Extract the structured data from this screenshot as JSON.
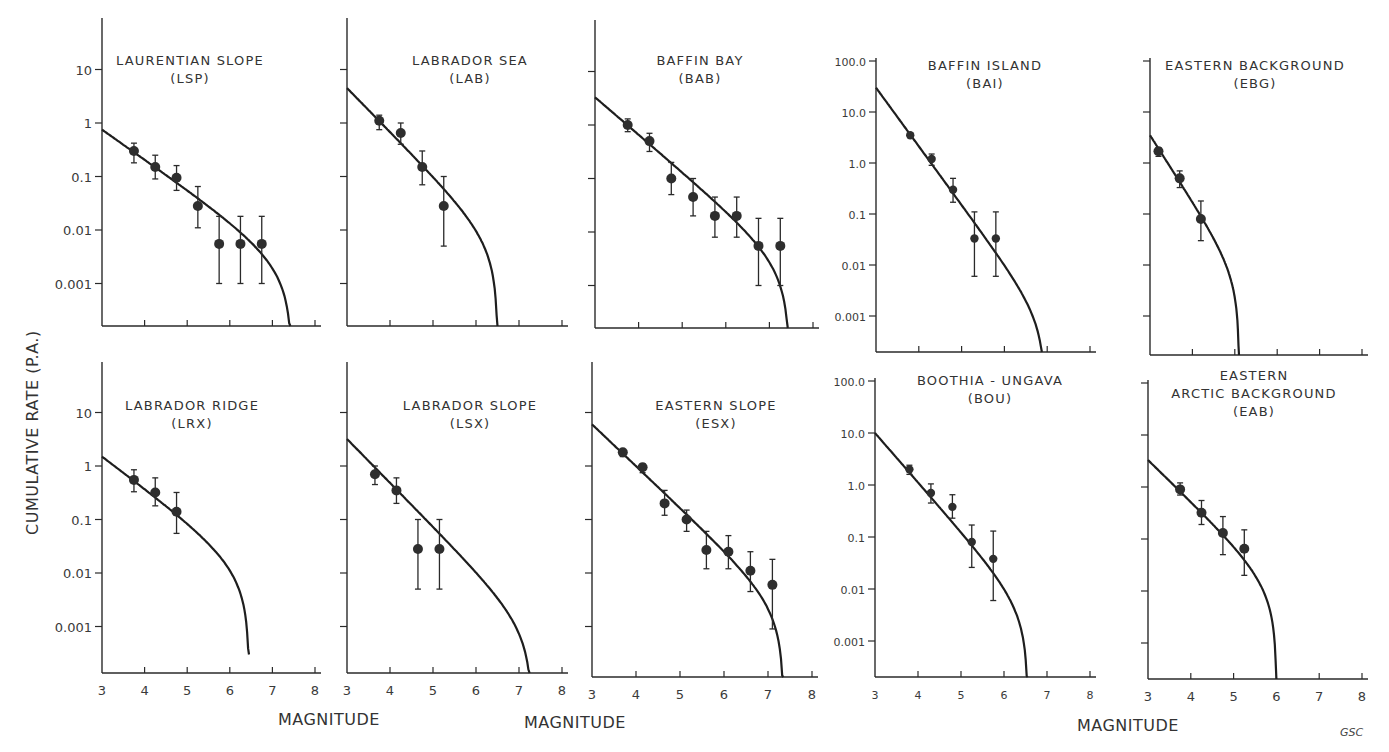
{
  "figure": {
    "ylabel": "CUMULATIVE   RATE      (P.A.)",
    "xlabels": [
      "MAGNITUDE",
      "MAGNITUDE",
      "MAGNITUDE"
    ],
    "credit": "GSC"
  },
  "chart_data": [
    {
      "type": "scatter",
      "id": "LSP",
      "title": "LAURENTIAN SLOPE",
      "subtitle": "(LSP)",
      "xlabel": "MAGNITUDE",
      "ylabel": "CUMULATIVE RATE (P.A.)",
      "yscale": "log",
      "xlim": [
        3,
        8
      ],
      "ylim": [
        0.0001,
        100
      ],
      "xticks": [
        "3",
        "4",
        "5",
        "6",
        "7",
        "8"
      ],
      "xtick_labels_visible": false,
      "yticks": [
        {
          "v": 10,
          "label": "10"
        },
        {
          "v": 1,
          "label": "1"
        },
        {
          "v": 0.1,
          "label": "0.1"
        },
        {
          "v": 0.01,
          "label": "0.01"
        },
        {
          "v": 0.001,
          "label": "0.001"
        }
      ],
      "points": [
        {
          "x": 3.75,
          "y": 0.3,
          "lo": 0.18,
          "hi": 0.42
        },
        {
          "x": 4.25,
          "y": 0.15,
          "lo": 0.09,
          "hi": 0.25
        },
        {
          "x": 4.75,
          "y": 0.095,
          "lo": 0.055,
          "hi": 0.16
        },
        {
          "x": 5.25,
          "y": 0.028,
          "lo": 0.011,
          "hi": 0.065
        },
        {
          "x": 5.75,
          "y": 0.0055,
          "lo": 0.001,
          "hi": 0.018
        },
        {
          "x": 6.25,
          "y": 0.0055,
          "lo": 0.001,
          "hi": 0.018
        },
        {
          "x": 6.75,
          "y": 0.0055,
          "lo": 0.001,
          "hi": 0.018
        }
      ],
      "fit": {
        "y_at_3": 0.75,
        "slope_per_mag": -0.56,
        "mmax": 7.45
      }
    },
    {
      "type": "scatter",
      "id": "LAB",
      "title": "LABRADOR  SEA",
      "subtitle": "(LAB)",
      "yscale": "log",
      "xlim": [
        3,
        8
      ],
      "ylim": [
        0.0001,
        100
      ],
      "xticks": [
        "3",
        "4",
        "5",
        "6",
        "7",
        "8"
      ],
      "xtick_labels_visible": false,
      "yticks": [
        {
          "v": 10,
          "label": ""
        },
        {
          "v": 1,
          "label": ""
        },
        {
          "v": 0.1,
          "label": ""
        },
        {
          "v": 0.01,
          "label": ""
        },
        {
          "v": 0.001,
          "label": ""
        }
      ],
      "points": [
        {
          "x": 3.75,
          "y": 1.1,
          "lo": 0.75,
          "hi": 1.4
        },
        {
          "x": 4.25,
          "y": 0.65,
          "lo": 0.4,
          "hi": 1.0
        },
        {
          "x": 4.75,
          "y": 0.15,
          "lo": 0.07,
          "hi": 0.3
        },
        {
          "x": 5.25,
          "y": 0.028,
          "lo": 0.005,
          "hi": 0.1
        }
      ],
      "fit": {
        "y_at_3": 4.5,
        "slope_per_mag": -0.82,
        "mmax": 6.5
      }
    },
    {
      "type": "scatter",
      "id": "BAB",
      "title": "BAFFIN  BAY",
      "subtitle": "(BAB)",
      "yscale": "log",
      "xlim": [
        3,
        8
      ],
      "ylim": [
        0.0001,
        100
      ],
      "xticks": [
        "3",
        "4",
        "5",
        "6",
        "7",
        "8"
      ],
      "xtick_labels_visible": false,
      "yticks": [
        {
          "v": 10,
          "label": ""
        },
        {
          "v": 1,
          "label": ""
        },
        {
          "v": 0.1,
          "label": ""
        },
        {
          "v": 0.01,
          "label": ""
        },
        {
          "v": 0.001,
          "label": ""
        }
      ],
      "points": [
        {
          "x": 3.75,
          "y": 1.0,
          "lo": 0.75,
          "hi": 1.3
        },
        {
          "x": 4.25,
          "y": 0.5,
          "lo": 0.32,
          "hi": 0.7
        },
        {
          "x": 4.75,
          "y": 0.1,
          "lo": 0.05,
          "hi": 0.2
        },
        {
          "x": 5.25,
          "y": 0.045,
          "lo": 0.02,
          "hi": 0.1
        },
        {
          "x": 5.75,
          "y": 0.02,
          "lo": 0.008,
          "hi": 0.045
        },
        {
          "x": 6.25,
          "y": 0.02,
          "lo": 0.008,
          "hi": 0.045
        },
        {
          "x": 6.75,
          "y": 0.0055,
          "lo": 0.001,
          "hi": 0.018
        },
        {
          "x": 7.25,
          "y": 0.0055,
          "lo": 0.001,
          "hi": 0.018
        }
      ],
      "fit": {
        "y_at_3": 3.3,
        "slope_per_mag": -0.7,
        "mmax": 7.45
      }
    },
    {
      "type": "scatter",
      "id": "BAI",
      "title": "BAFFIN  ISLAND",
      "subtitle": "(BAI)",
      "yscale": "log",
      "xlim": [
        3,
        8
      ],
      "ylim": [
        0.0002,
        100
      ],
      "xticks": [
        "3",
        "4",
        "5",
        "6",
        "7",
        "8"
      ],
      "xtick_labels_visible": false,
      "yticks": [
        {
          "v": 100,
          "label": "100.0"
        },
        {
          "v": 10,
          "label": "10.0"
        },
        {
          "v": 1,
          "label": "1.0"
        },
        {
          "v": 0.1,
          "label": "0.1"
        },
        {
          "v": 0.01,
          "label": "0.01"
        },
        {
          "v": 0.001,
          "label": "0.001"
        }
      ],
      "points": [
        {
          "x": 3.8,
          "y": 3.5,
          "lo": 3.2,
          "hi": 3.8
        },
        {
          "x": 4.3,
          "y": 1.2,
          "lo": 0.9,
          "hi": 1.5
        },
        {
          "x": 4.8,
          "y": 0.3,
          "lo": 0.17,
          "hi": 0.5
        },
        {
          "x": 5.3,
          "y": 0.033,
          "lo": 0.006,
          "hi": 0.11
        },
        {
          "x": 5.8,
          "y": 0.033,
          "lo": 0.006,
          "hi": 0.11
        }
      ],
      "fit": {
        "y_at_3": 30,
        "slope_per_mag": -1.15,
        "mmax": 6.95
      }
    },
    {
      "type": "scatter",
      "id": "EBG",
      "title": "EASTERN  BACKGROUND",
      "subtitle": "(EBG)",
      "yscale": "log",
      "xlim": [
        3,
        8
      ],
      "ylim": [
        0.0002,
        100
      ],
      "xticks": [
        "3",
        "4",
        "5",
        "6",
        "7",
        "8"
      ],
      "xtick_labels_visible": false,
      "yticks": [
        {
          "v": 100,
          "label": ""
        },
        {
          "v": 10,
          "label": ""
        },
        {
          "v": 1,
          "label": ""
        },
        {
          "v": 0.1,
          "label": ""
        },
        {
          "v": 0.01,
          "label": ""
        },
        {
          "v": 0.001,
          "label": ""
        }
      ],
      "points": [
        {
          "x": 3.2,
          "y": 1.7,
          "lo": 1.35,
          "hi": 2.0
        },
        {
          "x": 3.7,
          "y": 0.5,
          "lo": 0.33,
          "hi": 0.7
        },
        {
          "x": 4.2,
          "y": 0.08,
          "lo": 0.03,
          "hi": 0.18
        }
      ],
      "fit": {
        "y_at_3": 3.5,
        "slope_per_mag": -1.3,
        "mmax": 5.1
      }
    },
    {
      "type": "scatter",
      "id": "LRX",
      "title": "LABRADOR  RIDGE",
      "subtitle": "(LRX)",
      "yscale": "log",
      "xlim": [
        3,
        8
      ],
      "ylim": [
        0.0001,
        100
      ],
      "xticks": [
        "3",
        "4",
        "5",
        "6",
        "7",
        "8"
      ],
      "xtick_labels_visible": true,
      "yticks": [
        {
          "v": 10,
          "label": "10"
        },
        {
          "v": 1,
          "label": "1"
        },
        {
          "v": 0.1,
          "label": "0.1"
        },
        {
          "v": 0.01,
          "label": "0.01"
        },
        {
          "v": 0.001,
          "label": "0.001"
        }
      ],
      "points": [
        {
          "x": 3.75,
          "y": 0.55,
          "lo": 0.33,
          "hi": 0.85
        },
        {
          "x": 4.25,
          "y": 0.32,
          "lo": 0.18,
          "hi": 0.6
        },
        {
          "x": 4.75,
          "y": 0.14,
          "lo": 0.055,
          "hi": 0.32
        }
      ],
      "fit": {
        "y_at_3": 1.5,
        "slope_per_mag": -0.6,
        "mmax": 6.45
      },
      "fit_floor": 0.0003
    },
    {
      "type": "scatter",
      "id": "LSX",
      "title": "LABRADOR  SLOPE",
      "subtitle": "(LSX)",
      "yscale": "log",
      "xlim": [
        3,
        8
      ],
      "ylim": [
        0.0001,
        100
      ],
      "xticks": [
        "3",
        "4",
        "5",
        "6",
        "7",
        "8"
      ],
      "xtick_labels_visible": true,
      "yticks": [
        {
          "v": 10,
          "label": ""
        },
        {
          "v": 1,
          "label": ""
        },
        {
          "v": 0.1,
          "label": ""
        },
        {
          "v": 0.01,
          "label": ""
        },
        {
          "v": 0.001,
          "label": ""
        }
      ],
      "points": [
        {
          "x": 3.65,
          "y": 0.7,
          "lo": 0.45,
          "hi": 1.0
        },
        {
          "x": 4.15,
          "y": 0.35,
          "lo": 0.2,
          "hi": 0.6
        },
        {
          "x": 4.65,
          "y": 0.028,
          "lo": 0.005,
          "hi": 0.1
        },
        {
          "x": 5.15,
          "y": 0.028,
          "lo": 0.005,
          "hi": 0.1
        }
      ],
      "fit": {
        "y_at_3": 3.2,
        "slope_per_mag": -0.82,
        "mmax": 7.3
      }
    },
    {
      "type": "scatter",
      "id": "ESX",
      "title": "EASTERN  SLOPE",
      "subtitle": "(ESX)",
      "yscale": "log",
      "xlim": [
        3,
        8
      ],
      "ylim": [
        0.0001,
        100
      ],
      "xticks": [
        "3",
        "4",
        "5",
        "6",
        "7",
        "8"
      ],
      "xtick_labels_visible": true,
      "yticks": [
        {
          "v": 10,
          "label": ""
        },
        {
          "v": 1,
          "label": ""
        },
        {
          "v": 0.1,
          "label": ""
        },
        {
          "v": 0.01,
          "label": ""
        },
        {
          "v": 0.001,
          "label": ""
        }
      ],
      "points": [
        {
          "x": 3.7,
          "y": 1.8,
          "lo": 1.5,
          "hi": 2.0
        },
        {
          "x": 4.15,
          "y": 0.95,
          "lo": 0.75,
          "hi": 1.1
        },
        {
          "x": 4.65,
          "y": 0.2,
          "lo": 0.12,
          "hi": 0.35
        },
        {
          "x": 5.15,
          "y": 0.1,
          "lo": 0.06,
          "hi": 0.15
        },
        {
          "x": 5.6,
          "y": 0.027,
          "lo": 0.012,
          "hi": 0.06
        },
        {
          "x": 6.1,
          "y": 0.025,
          "lo": 0.012,
          "hi": 0.05
        },
        {
          "x": 6.6,
          "y": 0.011,
          "lo": 0.0045,
          "hi": 0.025
        },
        {
          "x": 7.1,
          "y": 0.006,
          "lo": 0.0009,
          "hi": 0.018
        }
      ],
      "fit": {
        "y_at_3": 6.0,
        "slope_per_mag": -0.78,
        "mmax": 7.35
      }
    },
    {
      "type": "scatter",
      "id": "BOU",
      "title": "BOOTHIA - UNGAVA",
      "subtitle": "(BOU)",
      "yscale": "log",
      "xlim": [
        3,
        8
      ],
      "ylim": [
        0.0002,
        100
      ],
      "xticks": [
        "3",
        "4",
        "5",
        "6",
        "7",
        "8"
      ],
      "xtick_labels_visible": true,
      "yticks": [
        {
          "v": 100,
          "label": "100.0"
        },
        {
          "v": 10,
          "label": "10.0"
        },
        {
          "v": 1,
          "label": "1.0"
        },
        {
          "v": 0.1,
          "label": "0.1"
        },
        {
          "v": 0.01,
          "label": "0.01"
        },
        {
          "v": 0.001,
          "label": "0.001"
        }
      ],
      "points": [
        {
          "x": 3.8,
          "y": 2.0,
          "lo": 1.6,
          "hi": 2.4
        },
        {
          "x": 4.3,
          "y": 0.7,
          "lo": 0.45,
          "hi": 1.05
        },
        {
          "x": 4.8,
          "y": 0.38,
          "lo": 0.23,
          "hi": 0.65
        },
        {
          "x": 5.25,
          "y": 0.08,
          "lo": 0.026,
          "hi": 0.17
        },
        {
          "x": 5.75,
          "y": 0.038,
          "lo": 0.006,
          "hi": 0.13
        }
      ],
      "fit": {
        "y_at_3": 10,
        "slope_per_mag": -0.95,
        "mmax": 6.55
      }
    },
    {
      "type": "scatter",
      "id": "EAB",
      "title": "EASTERN",
      "title2": "ARCTIC  BACKGROUND",
      "subtitle": "(EAB)",
      "yscale": "log",
      "xlim": [
        3,
        8
      ],
      "ylim": [
        0.0002,
        100
      ],
      "xticks": [
        "3",
        "4",
        "5",
        "6",
        "7",
        "8"
      ],
      "xtick_labels_visible": true,
      "yticks": [
        {
          "v": 100,
          "label": ""
        },
        {
          "v": 10,
          "label": ""
        },
        {
          "v": 1,
          "label": ""
        },
        {
          "v": 0.1,
          "label": ""
        },
        {
          "v": 0.01,
          "label": ""
        },
        {
          "v": 0.001,
          "label": ""
        }
      ],
      "points": [
        {
          "x": 3.75,
          "y": 0.9,
          "lo": 0.7,
          "hi": 1.2
        },
        {
          "x": 4.25,
          "y": 0.32,
          "lo": 0.19,
          "hi": 0.55
        },
        {
          "x": 4.75,
          "y": 0.13,
          "lo": 0.05,
          "hi": 0.27
        },
        {
          "x": 5.25,
          "y": 0.065,
          "lo": 0.02,
          "hi": 0.15
        }
      ],
      "fit": {
        "y_at_3": 3.3,
        "slope_per_mag": -0.8,
        "mmax": 6.0
      }
    }
  ]
}
